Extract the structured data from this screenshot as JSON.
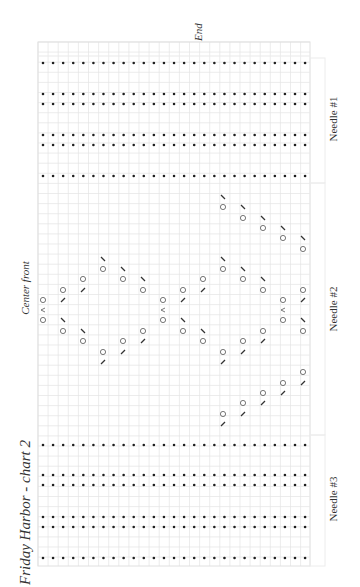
{
  "title": "Friday Harbor - chart 2",
  "labels": {
    "center_front": "Center front",
    "end": "End",
    "needles": [
      "Needle #1",
      "Needle #2",
      "Needle #3"
    ]
  },
  "grid": {
    "x0": 38,
    "y0": 42,
    "x1": 310,
    "y1": 566,
    "cell": 10.1,
    "line_color": "#e4e4e4",
    "border_color": "#e0e0e0"
  },
  "colors": {
    "ink": "#2a2a2a",
    "dot": "#1e1e1e",
    "symbol": "#555555"
  },
  "purl_dots": {
    "x_start": 43,
    "x_step": 10.08,
    "count": 27,
    "rows_y": [
      63,
      94,
      104,
      135,
      145,
      176,
      445,
      475,
      485,
      517,
      527,
      558
    ]
  },
  "legend_symbols": {
    "O": "yarn-over",
    "/": "k2tog",
    "\\": "ssk",
    "^": "central-double-decrease"
  },
  "lace_symbols": [
    {
      "x": 43,
      "y": 300,
      "s": "O"
    },
    {
      "x": 43,
      "y": 310,
      "s": "^"
    },
    {
      "x": 43,
      "y": 320,
      "s": "O"
    },
    {
      "x": 63,
      "y": 290,
      "s": "O"
    },
    {
      "x": 63,
      "y": 300,
      "s": "/"
    },
    {
      "x": 63,
      "y": 320,
      "s": "\\"
    },
    {
      "x": 63,
      "y": 331,
      "s": "O"
    },
    {
      "x": 83,
      "y": 279,
      "s": "O"
    },
    {
      "x": 83,
      "y": 290,
      "s": "/"
    },
    {
      "x": 83,
      "y": 331,
      "s": "\\"
    },
    {
      "x": 83,
      "y": 341,
      "s": "O"
    },
    {
      "x": 103,
      "y": 259,
      "s": "\\"
    },
    {
      "x": 103,
      "y": 269,
      "s": "O"
    },
    {
      "x": 103,
      "y": 352,
      "s": "O"
    },
    {
      "x": 103,
      "y": 362,
      "s": "/"
    },
    {
      "x": 123,
      "y": 269,
      "s": "\\"
    },
    {
      "x": 123,
      "y": 279,
      "s": "O"
    },
    {
      "x": 123,
      "y": 341,
      "s": "O"
    },
    {
      "x": 123,
      "y": 352,
      "s": "/"
    },
    {
      "x": 143,
      "y": 279,
      "s": "\\"
    },
    {
      "x": 143,
      "y": 290,
      "s": "O"
    },
    {
      "x": 143,
      "y": 331,
      "s": "O"
    },
    {
      "x": 143,
      "y": 341,
      "s": "/"
    },
    {
      "x": 163,
      "y": 300,
      "s": "O"
    },
    {
      "x": 163,
      "y": 310,
      "s": "^"
    },
    {
      "x": 163,
      "y": 320,
      "s": "O"
    },
    {
      "x": 183,
      "y": 290,
      "s": "O"
    },
    {
      "x": 183,
      "y": 300,
      "s": "/"
    },
    {
      "x": 183,
      "y": 320,
      "s": "\\"
    },
    {
      "x": 183,
      "y": 331,
      "s": "O"
    },
    {
      "x": 203,
      "y": 279,
      "s": "O"
    },
    {
      "x": 203,
      "y": 290,
      "s": "/"
    },
    {
      "x": 203,
      "y": 331,
      "s": "\\"
    },
    {
      "x": 203,
      "y": 341,
      "s": "O"
    },
    {
      "x": 223,
      "y": 197,
      "s": "\\"
    },
    {
      "x": 223,
      "y": 207,
      "s": "O"
    },
    {
      "x": 223,
      "y": 259,
      "s": "\\"
    },
    {
      "x": 223,
      "y": 269,
      "s": "O"
    },
    {
      "x": 223,
      "y": 352,
      "s": "O"
    },
    {
      "x": 223,
      "y": 362,
      "s": "/"
    },
    {
      "x": 223,
      "y": 414,
      "s": "O"
    },
    {
      "x": 223,
      "y": 424,
      "s": "/"
    },
    {
      "x": 243,
      "y": 207,
      "s": "\\"
    },
    {
      "x": 243,
      "y": 218,
      "s": "O"
    },
    {
      "x": 243,
      "y": 269,
      "s": "\\"
    },
    {
      "x": 243,
      "y": 279,
      "s": "O"
    },
    {
      "x": 243,
      "y": 341,
      "s": "O"
    },
    {
      "x": 243,
      "y": 352,
      "s": "/"
    },
    {
      "x": 243,
      "y": 403,
      "s": "O"
    },
    {
      "x": 243,
      "y": 414,
      "s": "/"
    },
    {
      "x": 263,
      "y": 218,
      "s": "\\"
    },
    {
      "x": 263,
      "y": 228,
      "s": "O"
    },
    {
      "x": 263,
      "y": 279,
      "s": "\\"
    },
    {
      "x": 263,
      "y": 290,
      "s": "O"
    },
    {
      "x": 263,
      "y": 331,
      "s": "O"
    },
    {
      "x": 263,
      "y": 341,
      "s": "/"
    },
    {
      "x": 263,
      "y": 393,
      "s": "O"
    },
    {
      "x": 263,
      "y": 403,
      "s": "/"
    },
    {
      "x": 283,
      "y": 228,
      "s": "\\"
    },
    {
      "x": 283,
      "y": 238,
      "s": "O"
    },
    {
      "x": 283,
      "y": 300,
      "s": "O"
    },
    {
      "x": 283,
      "y": 310,
      "s": "^"
    },
    {
      "x": 283,
      "y": 320,
      "s": "O"
    },
    {
      "x": 283,
      "y": 383,
      "s": "O"
    },
    {
      "x": 283,
      "y": 393,
      "s": "/"
    },
    {
      "x": 303,
      "y": 238,
      "s": "\\"
    },
    {
      "x": 303,
      "y": 249,
      "s": "O"
    },
    {
      "x": 303,
      "y": 290,
      "s": "O"
    },
    {
      "x": 303,
      "y": 300,
      "s": "/"
    },
    {
      "x": 303,
      "y": 320,
      "s": "\\"
    },
    {
      "x": 303,
      "y": 331,
      "s": "O"
    },
    {
      "x": 303,
      "y": 372,
      "s": "O"
    },
    {
      "x": 303,
      "y": 383,
      "s": "/"
    }
  ],
  "needle_sections": [
    {
      "label_y": 120,
      "y0": 58,
      "y1": 183
    },
    {
      "label_y": 310,
      "y0": 183,
      "y1": 435
    },
    {
      "label_y": 500,
      "y0": 435,
      "y1": 566
    }
  ]
}
